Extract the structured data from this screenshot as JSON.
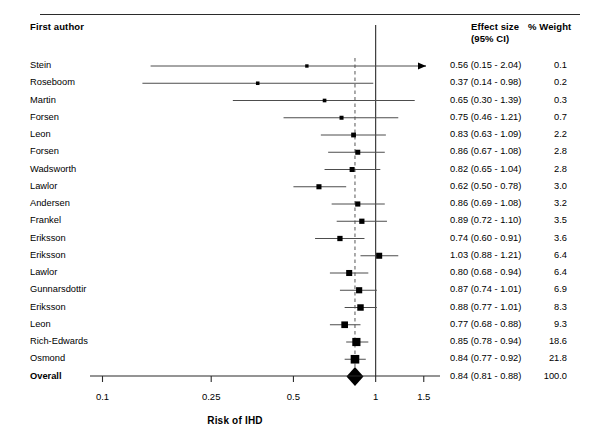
{
  "figure": {
    "type": "forest-plot",
    "columns": {
      "author_header": "First author",
      "effect_header_line1": "Effect size",
      "effect_header_line2": "(95% CI)",
      "weight_header": "% Weight"
    },
    "xlabel": "Risk of IHD",
    "axis": {
      "scale": "log",
      "ticks": [
        0.1,
        0.25,
        0.5,
        1,
        1.5
      ],
      "tick_labels": [
        "0.1",
        "0.25",
        "0.5",
        "1",
        "1.5"
      ],
      "min": 0.09,
      "max": 1.72,
      "null_line": 1,
      "summary_line": 0.84
    },
    "colors": {
      "marker": "#000000",
      "line": "#4d4d4d",
      "axis": "#2b2b2b",
      "text": "#000000"
    }
  },
  "chart_data": {
    "type": "forest",
    "title": "",
    "xlabel": "Risk of IHD",
    "ylabel": "",
    "xscale": "log",
    "xlim": [
      0.09,
      1.72
    ],
    "xticks": [
      0.1,
      0.25,
      0.5,
      1,
      1.5
    ],
    "grid": false,
    "legend": "none",
    "reference_line": 1,
    "summary_line": 0.84,
    "columns": [
      "First author",
      "Effect size (95% CI)",
      "% Weight"
    ],
    "rows": [
      {
        "author": "Stein",
        "estimate": 0.56,
        "ci_low": 0.15,
        "ci_high": 2.04,
        "weight": 0.1,
        "effect_text": "0.56 (0.15 - 2.04)",
        "weight_text": "0.1",
        "clipped_right": true
      },
      {
        "author": "Roseboom",
        "estimate": 0.37,
        "ci_low": 0.14,
        "ci_high": 0.98,
        "weight": 0.2,
        "effect_text": "0.37 (0.14 - 0.98)",
        "weight_text": "0.2",
        "clipped_right": false
      },
      {
        "author": "Martin",
        "estimate": 0.65,
        "ci_low": 0.3,
        "ci_high": 1.39,
        "weight": 0.3,
        "effect_text": "0.65 (0.30 - 1.39)",
        "weight_text": "0.3",
        "clipped_right": false
      },
      {
        "author": "Forsen",
        "estimate": 0.75,
        "ci_low": 0.46,
        "ci_high": 1.21,
        "weight": 0.7,
        "effect_text": "0.75 (0.46 - 1.21)",
        "weight_text": "0.7",
        "clipped_right": false
      },
      {
        "author": "Leon",
        "estimate": 0.83,
        "ci_low": 0.63,
        "ci_high": 1.09,
        "weight": 2.2,
        "effect_text": "0.83 (0.63 - 1.09)",
        "weight_text": "2.2",
        "clipped_right": false
      },
      {
        "author": "Forsen",
        "estimate": 0.86,
        "ci_low": 0.67,
        "ci_high": 1.08,
        "weight": 2.8,
        "effect_text": "0.86 (0.67 - 1.08)",
        "weight_text": "2.8",
        "clipped_right": false
      },
      {
        "author": "Wadsworth",
        "estimate": 0.82,
        "ci_low": 0.65,
        "ci_high": 1.04,
        "weight": 2.8,
        "effect_text": "0.82 (0.65 - 1.04)",
        "weight_text": "2.8",
        "clipped_right": false
      },
      {
        "author": "Lawlor",
        "estimate": 0.62,
        "ci_low": 0.5,
        "ci_high": 0.78,
        "weight": 3.0,
        "effect_text": "0.62 (0.50 - 0.78)",
        "weight_text": "3.0",
        "clipped_right": false
      },
      {
        "author": "Andersen",
        "estimate": 0.86,
        "ci_low": 0.69,
        "ci_high": 1.08,
        "weight": 3.2,
        "effect_text": "0.86 (0.69 - 1.08)",
        "weight_text": "3.2",
        "clipped_right": false
      },
      {
        "author": "Frankel",
        "estimate": 0.89,
        "ci_low": 0.72,
        "ci_high": 1.1,
        "weight": 3.5,
        "effect_text": "0.89 (0.72 - 1.10)",
        "weight_text": "3.5",
        "clipped_right": false
      },
      {
        "author": "Eriksson",
        "estimate": 0.74,
        "ci_low": 0.6,
        "ci_high": 0.91,
        "weight": 3.6,
        "effect_text": "0.74 (0.60 - 0.91)",
        "weight_text": "3.6",
        "clipped_right": false
      },
      {
        "author": "Eriksson",
        "estimate": 1.03,
        "ci_low": 0.88,
        "ci_high": 1.21,
        "weight": 6.4,
        "effect_text": "1.03 (0.88 - 1.21)",
        "weight_text": "6.4",
        "clipped_right": false
      },
      {
        "author": "Lawlor",
        "estimate": 0.8,
        "ci_low": 0.68,
        "ci_high": 0.94,
        "weight": 6.4,
        "effect_text": "0.80 (0.68 - 0.94)",
        "weight_text": "6.4",
        "clipped_right": false
      },
      {
        "author": "Gunnarsdottir",
        "estimate": 0.87,
        "ci_low": 0.74,
        "ci_high": 1.01,
        "weight": 6.9,
        "effect_text": "0.87 (0.74 - 1.01)",
        "weight_text": "6.9",
        "clipped_right": false
      },
      {
        "author": "Eriksson",
        "estimate": 0.88,
        "ci_low": 0.77,
        "ci_high": 1.01,
        "weight": 8.3,
        "effect_text": "0.88 (0.77 - 1.01)",
        "weight_text": "8.3",
        "clipped_right": false
      },
      {
        "author": "Leon",
        "estimate": 0.77,
        "ci_low": 0.68,
        "ci_high": 0.88,
        "weight": 9.3,
        "effect_text": "0.77 (0.68 - 0.88)",
        "weight_text": "9.3",
        "clipped_right": false
      },
      {
        "author": "Rich-Edwards",
        "estimate": 0.85,
        "ci_low": 0.78,
        "ci_high": 0.94,
        "weight": 18.6,
        "effect_text": "0.85 (0.78 - 0.94)",
        "weight_text": "18.6",
        "clipped_right": false
      },
      {
        "author": "Osmond",
        "estimate": 0.84,
        "ci_low": 0.77,
        "ci_high": 0.92,
        "weight": 21.8,
        "effect_text": "0.84 (0.77 - 0.92)",
        "weight_text": "21.8",
        "clipped_right": false
      }
    ],
    "summary": {
      "author": "Overall",
      "estimate": 0.84,
      "ci_low": 0.81,
      "ci_high": 0.88,
      "weight": 100.0,
      "effect_text": "0.84 (0.81 - 0.88)",
      "weight_text": "100.0"
    }
  }
}
